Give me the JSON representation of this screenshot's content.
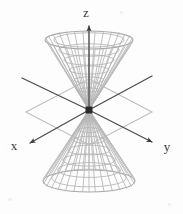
{
  "figure": {
    "title": "",
    "background_color": "#fdfdfd",
    "width": 183,
    "height": 214,
    "axes": {
      "line_color": "#4f4f4f",
      "arrow_color": "#3a3a3a",
      "label_color": "#3a3a3a",
      "items": [
        {
          "name": "z",
          "label": "z",
          "label_x": 86,
          "label_y": 17,
          "start_x": 89,
          "start_y": 110,
          "end_x": 89,
          "end_y": 24,
          "arrow": true
        },
        {
          "name": "x",
          "label": "x",
          "label_x": 14,
          "label_y": 148,
          "start_x": 89,
          "start_y": 110,
          "end_x": 27,
          "end_y": 145,
          "arrow": true
        },
        {
          "name": "y",
          "label": "y",
          "label_x": 163,
          "label_y": 150,
          "start_x": 89,
          "start_y": 110,
          "end_x": 156,
          "end_y": 144,
          "arrow": true
        },
        {
          "name": "x-negative",
          "label": "",
          "label_x": 0,
          "label_y": 0,
          "start_x": 89,
          "start_y": 110,
          "end_x": 152,
          "end_y": 76,
          "arrow": false
        },
        {
          "name": "y-negative",
          "label": "",
          "label_x": 0,
          "label_y": 0,
          "start_x": 89,
          "start_y": 110,
          "end_x": 22,
          "end_y": 78,
          "arrow": false
        }
      ]
    },
    "origin": {
      "label": "",
      "x": 89,
      "y": 110,
      "size": 7,
      "color": "#2b2b2b"
    },
    "plane": {
      "name": "xy-plane",
      "stroke": "#bdbdbd",
      "fill": "none",
      "points": "89,79 152,112 89,145 26,112"
    },
    "cone": {
      "mesh_color": "#b5b5b5",
      "rim_color": "#a8a8a8",
      "apex_x": 89,
      "apex_y": 110,
      "upper": {
        "name": "upper-nappe",
        "rim_cy": 40,
        "rim_rx": 44,
        "rim_ry": 9,
        "rim_top_y": 31
      },
      "lower": {
        "name": "lower-nappe",
        "rim_cy": 181,
        "rim_rx": 46,
        "rim_ry": 11,
        "rim_bottom_y": 192
      },
      "radial_lines": 24,
      "rings": 7
    }
  }
}
